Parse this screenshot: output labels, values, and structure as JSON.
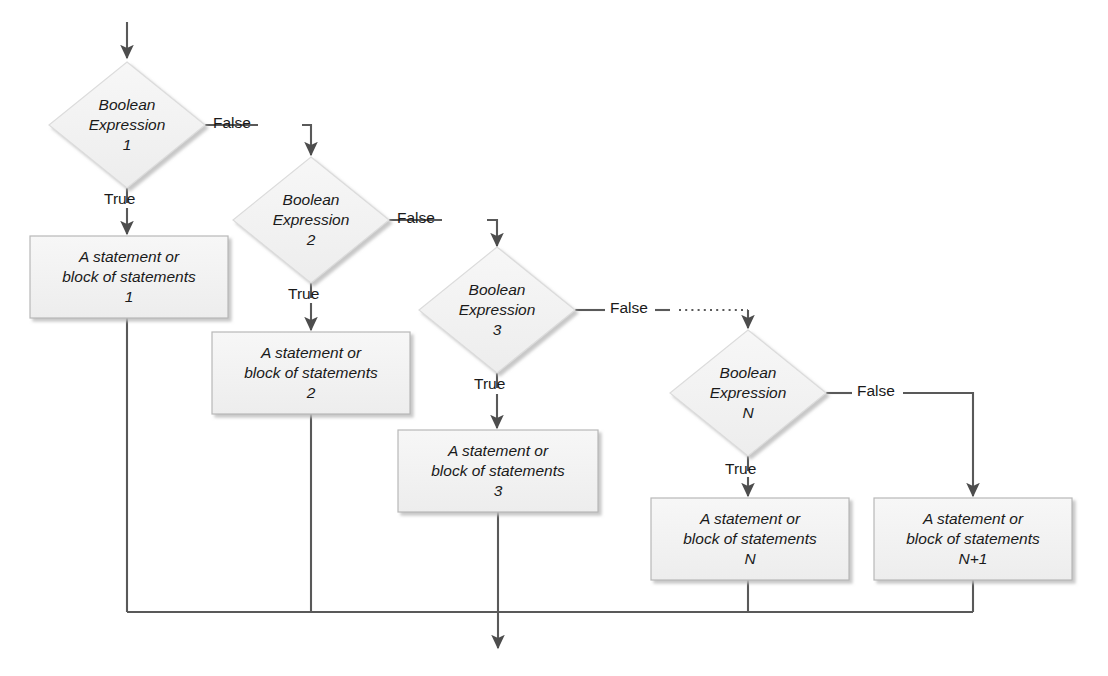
{
  "diagram": {
    "type": "flowchart",
    "colors": {
      "shape_fill": "#f2f2f2",
      "shape_stroke": "#d9d9d9",
      "box_stroke": "#bfbfbf",
      "line": "#595959",
      "text": "#1a1a1a",
      "shadow": "#d0d0d0",
      "background": "#ffffff"
    },
    "decisions": [
      {
        "id": "d1",
        "line1": "Boolean",
        "line2": "Expression",
        "line3": "1",
        "cx": 127,
        "cy": 125,
        "rx": 78,
        "ry": 63
      },
      {
        "id": "d2",
        "line1": "Boolean",
        "line2": "Expression",
        "line3": "2",
        "cx": 311,
        "cy": 220,
        "rx": 78,
        "ry": 63
      },
      {
        "id": "d3",
        "line1": "Boolean",
        "line2": "Expression",
        "line3": "3",
        "cx": 497,
        "cy": 310,
        "rx": 78,
        "ry": 63
      },
      {
        "id": "dN",
        "line1": "Boolean",
        "line2": "Expression",
        "line3": "N",
        "cx": 748,
        "cy": 393,
        "rx": 78,
        "ry": 63
      }
    ],
    "processes": [
      {
        "id": "p1",
        "line1": "A statement or",
        "line2": "block of statements",
        "line3": "1",
        "x": 30,
        "y": 236,
        "w": 198,
        "h": 82
      },
      {
        "id": "p2",
        "line1": "A statement or",
        "line2": "block of statements",
        "line3": "2",
        "x": 212,
        "y": 332,
        "w": 198,
        "h": 82
      },
      {
        "id": "p3",
        "line1": "A statement or",
        "line2": "block of statements",
        "line3": "3",
        "x": 398,
        "y": 430,
        "w": 200,
        "h": 82
      },
      {
        "id": "pN",
        "line1": "A statement or",
        "line2": "block of statements",
        "line3": "N",
        "x": 651,
        "y": 498,
        "w": 198,
        "h": 82
      },
      {
        "id": "pN1",
        "line1": "A statement or",
        "line2": "block of statements",
        "line3": "N+1",
        "x": 874,
        "y": 498,
        "w": 198,
        "h": 82
      }
    ],
    "edge_labels": [
      {
        "id": "false1",
        "text": "False",
        "x": 213,
        "y": 114
      },
      {
        "id": "true1",
        "text": "True",
        "x": 104,
        "y": 190
      },
      {
        "id": "false2",
        "text": "False",
        "x": 397,
        "y": 209
      },
      {
        "id": "true2",
        "text": "True",
        "x": 288,
        "y": 285
      },
      {
        "id": "false3",
        "text": "False",
        "x": 610,
        "y": 299
      },
      {
        "id": "true3",
        "text": "True",
        "x": 474,
        "y": 375
      },
      {
        "id": "falseN",
        "text": "False",
        "x": 860,
        "y": 382
      },
      {
        "id": "trueN",
        "text": "True",
        "x": 725,
        "y": 460
      }
    ],
    "connector_notes": {
      "entry_arrow": "top arrow into Boolean Expression 1",
      "ellipsis": "dotted continuation between Expression 3 False branch and Expression N",
      "merge_line_y": 612,
      "exit_arrow_x": 498
    }
  }
}
